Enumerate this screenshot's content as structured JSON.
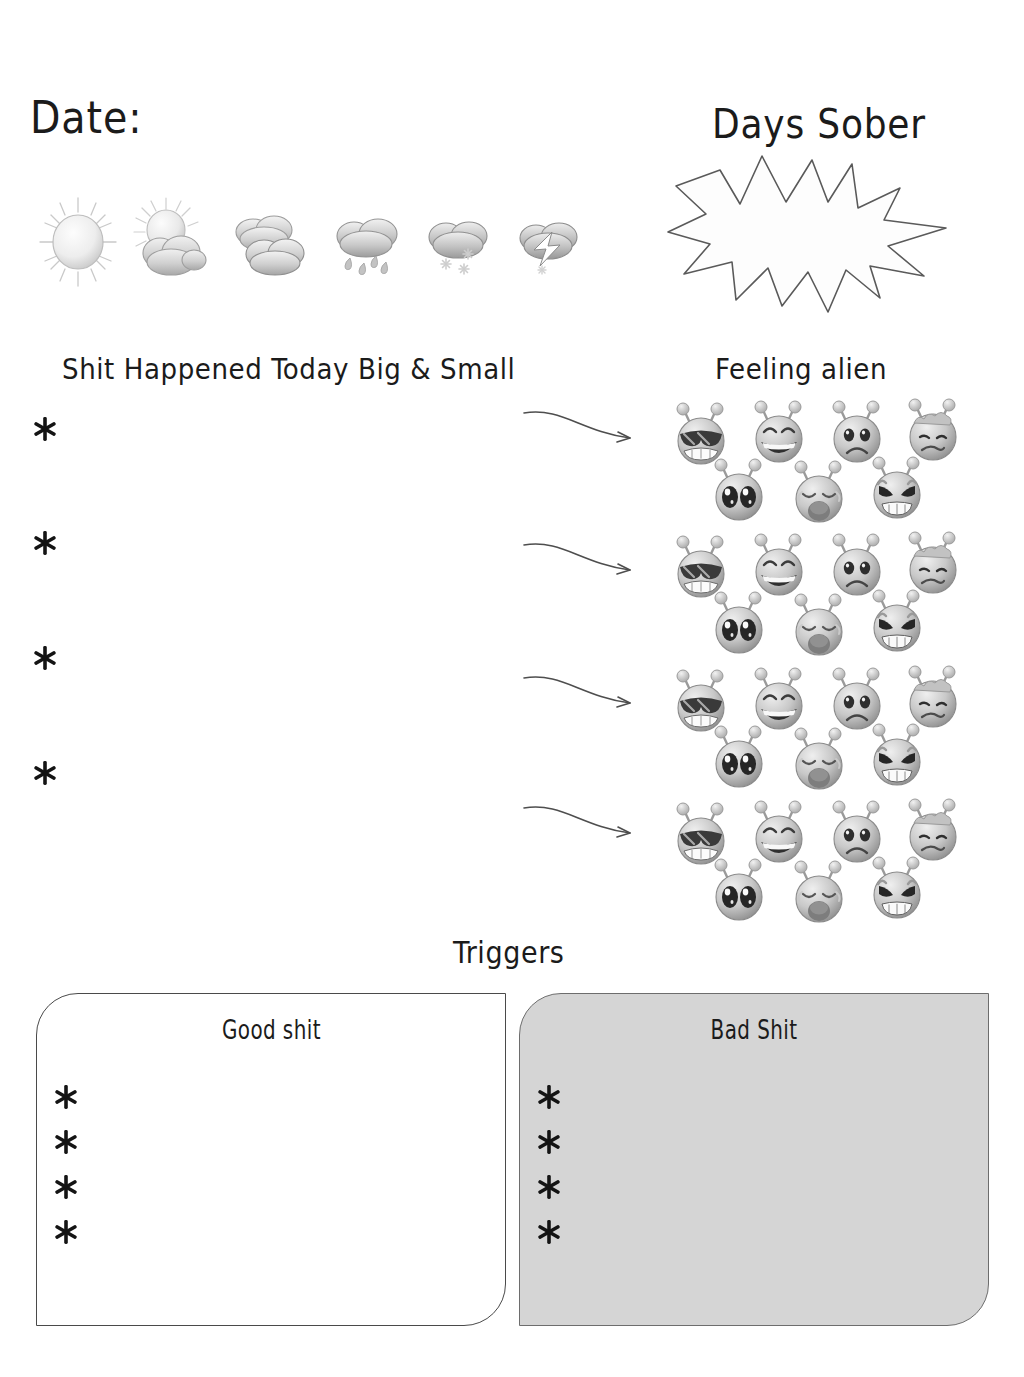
{
  "page": {
    "background_color": "#ffffff",
    "ink_color": "#1b1b1b"
  },
  "date_section": {
    "label": "Date:"
  },
  "weather_section": {
    "options": [
      {
        "id": "sunny",
        "icon": "sun-icon",
        "label": "Sunny"
      },
      {
        "id": "partly",
        "icon": "sun-behind-cloud-icon",
        "label": "Partly cloudy"
      },
      {
        "id": "cloudy",
        "icon": "clouds-icon",
        "label": "Cloudy"
      },
      {
        "id": "rain",
        "icon": "rain-cloud-icon",
        "label": "Rain"
      },
      {
        "id": "snow",
        "icon": "snow-cloud-icon",
        "label": "Snow"
      },
      {
        "id": "storm",
        "icon": "lightning-cloud-icon",
        "label": "Storm"
      }
    ]
  },
  "days_sober": {
    "title": "Days Sober",
    "burst_value": "",
    "burst_shape": "starburst-14-point"
  },
  "shit_happened": {
    "heading": "Shit Happened Today Big & Small",
    "bullets": [
      "",
      "",
      "",
      ""
    ],
    "bullet_glyph": "asterisk"
  },
  "feeling_alien": {
    "heading": "Feeling alien",
    "rows": 4,
    "arrow_icon": "curved-arrow-right-icon",
    "faces": [
      {
        "id": "cool",
        "icon": "alien-sunglasses-icon",
        "label": "Cool"
      },
      {
        "id": "happy",
        "icon": "alien-laughing-icon",
        "label": "Happy"
      },
      {
        "id": "sad",
        "icon": "alien-sad-icon",
        "label": "Sad"
      },
      {
        "id": "sick",
        "icon": "alien-sick-icon",
        "label": "Sick"
      },
      {
        "id": "starry",
        "icon": "alien-starry-eyes-icon",
        "label": "Excited"
      },
      {
        "id": "crying",
        "icon": "alien-crying-icon",
        "label": "Crying"
      },
      {
        "id": "angry",
        "icon": "alien-angry-icon",
        "label": "Angry"
      }
    ]
  },
  "triggers": {
    "heading": "Triggers",
    "good": {
      "title": "Good shit",
      "bullets": [
        "",
        "",
        "",
        ""
      ],
      "fill_color": "#ffffff",
      "border_color": "#4a4a4a"
    },
    "bad": {
      "title": "Bad Shit",
      "bullets": [
        "",
        "",
        "",
        ""
      ],
      "fill_color": "#d5d5d5",
      "border_color": "#6d6d6d"
    }
  }
}
